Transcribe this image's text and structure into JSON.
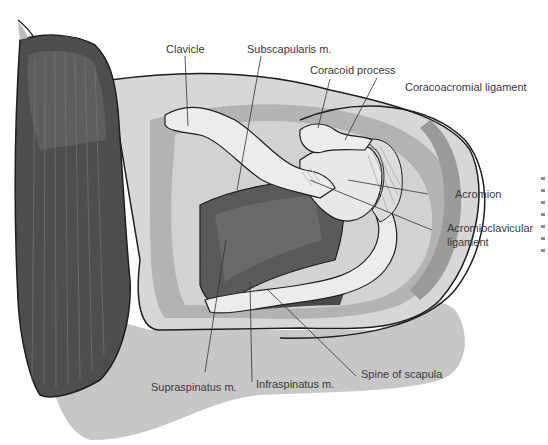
{
  "figure": {
    "type": "anatomical-illustration",
    "palette": {
      "background": "#ffffff",
      "muscle_dark": "#4d4d4d",
      "muscle_mid": "#6e6e6e",
      "skin_light": "#d9d9d9",
      "skin_mid": "#bdbdbd",
      "skin_shadow": "#a3a3a3",
      "bone": "#ececec",
      "outline": "#1e1e1e",
      "leader_line": "#333333",
      "label_text": "#3a3a3a"
    }
  },
  "labels": {
    "clavicle": "Clavicle",
    "subscapularis": "Subscapularis m.",
    "coracoid_process": "Coracoid process",
    "coracoacromial_ligament": "Coracoacromial ligament",
    "acromion": "Acromion",
    "acromioclavicular_ligament_line1": "Acromioclavicular",
    "acromioclavicular_ligament_line2": "ligament",
    "supraspinatus": "Supraspinatus m.",
    "infraspinatus": "Infraspinatus m.",
    "spine_of_scapula": "Spine of scapula"
  }
}
